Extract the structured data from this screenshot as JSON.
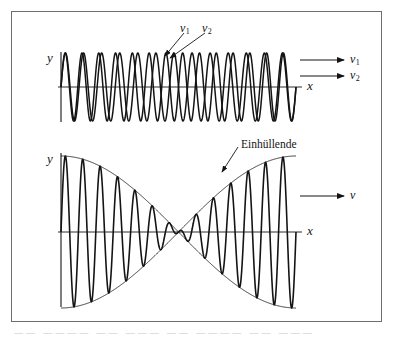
{
  "figure": {
    "kind": "physics-diagram",
    "topic": "Schwebung / beats of two superposed waves",
    "frame": {
      "border_color": "#6e6e6e",
      "background": "#ffffff"
    },
    "stroke_color": "#141414"
  },
  "top_plot": {
    "name": "two-superposed-waves",
    "y_axis_label": "y",
    "x_axis_label": "x",
    "callouts": [
      {
        "label": "v",
        "sub": "1"
      },
      {
        "label": "v",
        "sub": "2"
      }
    ],
    "right_arrows": [
      {
        "label": "v",
        "sub": "1"
      },
      {
        "label": "v",
        "sub": "2"
      }
    ]
  },
  "bottom_plot": {
    "name": "beat-superposition",
    "y_axis_label": "y",
    "x_axis_label": "x",
    "envelope_label": "Einhüllende",
    "right_arrows": [
      {
        "label": "v",
        "sub": ""
      }
    ]
  },
  "caption": {
    "text": "——  ————  ——  ———  ——  ————  ——  ———"
  },
  "chart_data": {
    "type": "line",
    "title": "",
    "xlabel": "x",
    "ylabel": "y",
    "grid": false,
    "legend": "inline-arrows",
    "panels": [
      {
        "id": "top",
        "description": "Two sinusoidal waves of slightly different frequency drawn overlapping.",
        "x_range": [
          0,
          1
        ],
        "y_range": [
          -1.15,
          1.15
        ],
        "series": [
          {
            "name": "v1",
            "cycles": 13,
            "amplitude": 1.0,
            "phase_deg": 0
          },
          {
            "name": "v2",
            "cycles": 14,
            "amplitude": 1.0,
            "phase_deg": 0
          }
        ]
      },
      {
        "id": "bottom",
        "description": "Sum of the two waves showing beats, with the slowly varying envelope drawn as a thin curve.",
        "x_range": [
          0,
          1
        ],
        "y_range": [
          -1.15,
          1.15
        ],
        "series": [
          {
            "name": "sum",
            "cycles": 13.5,
            "amplitude": 1.0,
            "phase_deg": 0
          },
          {
            "name": "envelope_upper",
            "cycles": 0.5,
            "amplitude": 1.0,
            "phase_deg": 0
          },
          {
            "name": "envelope_lower",
            "cycles": 0.5,
            "amplitude": -1.0,
            "phase_deg": 0
          }
        ]
      }
    ]
  }
}
